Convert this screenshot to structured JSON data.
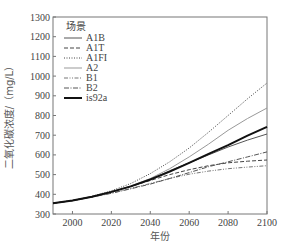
{
  "chart_data": {
    "type": "line",
    "title": "",
    "xlabel": "年份",
    "ylabel": "二氧化碳浓度/（mg/L）",
    "xlim": [
      1990,
      2100
    ],
    "ylim": [
      300,
      1300
    ],
    "x_ticks": [
      2000,
      2020,
      2040,
      2060,
      2080,
      2100
    ],
    "y_ticks": [
      300,
      400,
      500,
      600,
      700,
      800,
      900,
      1000,
      1100,
      1200,
      1300
    ],
    "grid": false,
    "legend_title": "场景",
    "legend_position": "upper-left",
    "x": [
      1990,
      2000,
      2010,
      2020,
      2030,
      2040,
      2050,
      2060,
      2070,
      2080,
      2090,
      2100
    ],
    "series": [
      {
        "name": "A1B",
        "style": "solid-thin",
        "color": "#555555",
        "values": [
          355,
          368,
          388,
          412,
          440,
          475,
          520,
          560,
          600,
          640,
          675,
          706
        ]
      },
      {
        "name": "A1T",
        "style": "dashed",
        "color": "#444444",
        "values": [
          355,
          368,
          388,
          412,
          440,
          470,
          500,
          525,
          545,
          560,
          568,
          574
        ]
      },
      {
        "name": "A1FI",
        "style": "dotted",
        "color": "#444444",
        "values": [
          355,
          368,
          390,
          418,
          455,
          505,
          565,
          635,
          715,
          800,
          885,
          965
        ]
      },
      {
        "name": "A2",
        "style": "solid-light",
        "color": "#999999",
        "values": [
          355,
          368,
          388,
          412,
          442,
          480,
          530,
          590,
          655,
          725,
          785,
          838
        ]
      },
      {
        "name": "B1",
        "style": "dash-dot-dot",
        "color": "#777777",
        "values": [
          355,
          368,
          386,
          406,
          430,
          455,
          480,
          502,
          518,
          530,
          538,
          545
        ]
      },
      {
        "name": "B2",
        "style": "dash-dot",
        "color": "#555555",
        "values": [
          355,
          368,
          386,
          405,
          428,
          452,
          480,
          510,
          540,
          565,
          590,
          615
        ]
      },
      {
        "name": "is92a",
        "style": "solid-thick",
        "color": "#111111",
        "values": [
          355,
          368,
          388,
          412,
          440,
          475,
          515,
          560,
          605,
          650,
          698,
          742
        ]
      }
    ]
  }
}
